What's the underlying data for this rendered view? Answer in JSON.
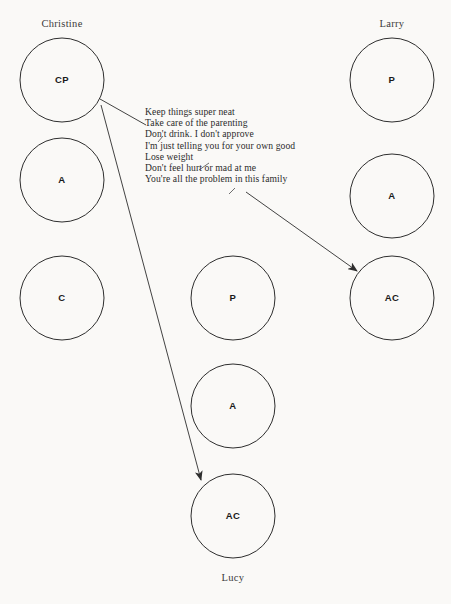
{
  "diagram": {
    "background_color": "#faf9f7",
    "stroke_color": "#2e2e2e",
    "text_color": "#2b2b2b"
  },
  "people": [
    {
      "key": "christine",
      "name": "Christine",
      "name_x": 62,
      "name_y": 27,
      "label_position": "top",
      "column_cx": 62,
      "states": [
        {
          "key": "cp",
          "label": "CP",
          "cx": 62,
          "cy": 80,
          "r": 42
        },
        {
          "key": "a",
          "label": "A",
          "cx": 62,
          "cy": 180,
          "r": 42
        },
        {
          "key": "c",
          "label": "C",
          "cx": 62,
          "cy": 298,
          "r": 42
        }
      ]
    },
    {
      "key": "lucy",
      "name": "Lucy",
      "name_x": 233,
      "name_y": 581,
      "label_position": "bottom",
      "column_cx": 233,
      "states": [
        {
          "key": "p",
          "label": "P",
          "cx": 233,
          "cy": 298,
          "r": 42
        },
        {
          "key": "a",
          "label": "A",
          "cx": 233,
          "cy": 406,
          "r": 42
        },
        {
          "key": "ac",
          "label": "AC",
          "cx": 233,
          "cy": 516,
          "r": 42
        }
      ]
    },
    {
      "key": "larry",
      "name": "Larry",
      "name_x": 392,
      "name_y": 27,
      "label_position": "top",
      "column_cx": 392,
      "states": [
        {
          "key": "p",
          "label": "P",
          "cx": 392,
          "cy": 80,
          "r": 42
        },
        {
          "key": "a",
          "label": "A",
          "cx": 392,
          "cy": 196,
          "r": 42
        },
        {
          "key": "ac",
          "label": "AC",
          "cx": 392,
          "cy": 298,
          "r": 42
        }
      ]
    }
  ],
  "messages": {
    "x": 145,
    "start_y": 115,
    "line_height": 11.2,
    "lines": [
      "Keep things super neat",
      "Take care of the parenting",
      "Don't drink. I don't approve",
      "I'm just telling you for your own good",
      "Lose weight",
      "Don't feel hurt or mad at me",
      "You're all the problem in this family"
    ]
  },
  "connectors": [
    {
      "key": "christine-cp-to-messages",
      "description": "line from Christine CP to the message text block",
      "x1": 100,
      "y1": 99,
      "x2": 146,
      "y2": 125,
      "arrow": false
    },
    {
      "key": "christine-cp-to-lucy-ac",
      "description": "arrow from Christine CP down to Lucy AC",
      "x1": 101,
      "y1": 105,
      "x2": 201,
      "y2": 480,
      "arrow": true
    },
    {
      "key": "messages-to-larry-ac",
      "description": "arrow from message block to Larry AC",
      "x1": 246,
      "y1": 192,
      "x2": 357,
      "y2": 271,
      "arrow": true
    }
  ],
  "tick_marks": [
    {
      "key": "tick-parenting",
      "x1": 158,
      "y1": 142,
      "x2": 163,
      "y2": 136
    },
    {
      "key": "tick-lose-weight",
      "x1": 199,
      "y1": 170,
      "x2": 209,
      "y2": 163
    },
    {
      "key": "tick-family",
      "x1": 229,
      "y1": 194,
      "x2": 235,
      "y2": 188
    }
  ]
}
